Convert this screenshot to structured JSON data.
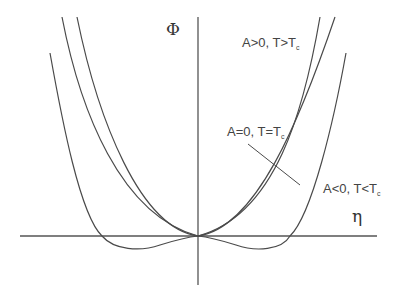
{
  "diagram": {
    "type": "landau-free-energy-curves",
    "axes": {
      "y_label": "Φ",
      "x_label": "η"
    },
    "curves": [
      {
        "id": "a-positive",
        "label_main": "A>0, T>T",
        "label_sub": "c"
      },
      {
        "id": "a-zero",
        "label_main": "A=0, T=T",
        "label_sub": "c"
      },
      {
        "id": "a-negative",
        "label_main": "A<0, T<T",
        "label_sub": "c"
      }
    ],
    "stroke_color": "#4a4a4a",
    "background": "#ffffff"
  }
}
